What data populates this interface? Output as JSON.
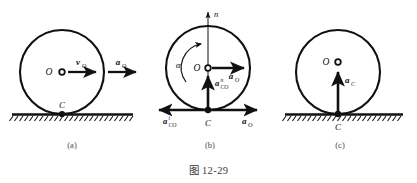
{
  "figure": {
    "title": "图 12-29",
    "background_color": "#ffffff",
    "ink_color": "#111111"
  },
  "panels": [
    {
      "id": "a",
      "caption": "(a)",
      "center_label": "O",
      "contact_label": "C",
      "vectors": [
        {
          "name": "velocity-of-center",
          "label_main": "v",
          "label_sub": "O",
          "direction": "right"
        },
        {
          "name": "acceleration-of-center",
          "label_main": "a",
          "label_sub": "O",
          "direction": "right"
        }
      ],
      "ground": "hatched-line"
    },
    {
      "id": "b",
      "caption": "(b)",
      "center_label": "O",
      "contact_label": "C",
      "axis_label": "n",
      "angular_accel_label": "α",
      "vectors": [
        {
          "name": "acceleration-of-center",
          "label_main": "a",
          "label_sub": "O",
          "label_sup": "",
          "direction": "right"
        },
        {
          "name": "normal-relative-acceleration",
          "label_main": "a",
          "label_sub": "CO",
          "label_sup": "n",
          "direction": "up"
        },
        {
          "name": "tangential-relative-acceleration",
          "label_main": "a",
          "label_sub": "CO",
          "label_sup": "t",
          "direction": "left"
        },
        {
          "name": "base-point-acceleration",
          "label_main": "a",
          "label_sub": "O",
          "label_sup": "",
          "direction": "right"
        }
      ],
      "ground": "none"
    },
    {
      "id": "c",
      "caption": "(c)",
      "center_label": "O",
      "contact_label": "C",
      "vectors": [
        {
          "name": "acceleration-of-contact-point",
          "label_main": "a",
          "label_sub": "C",
          "direction": "up"
        }
      ],
      "ground": "hatched-line"
    }
  ]
}
